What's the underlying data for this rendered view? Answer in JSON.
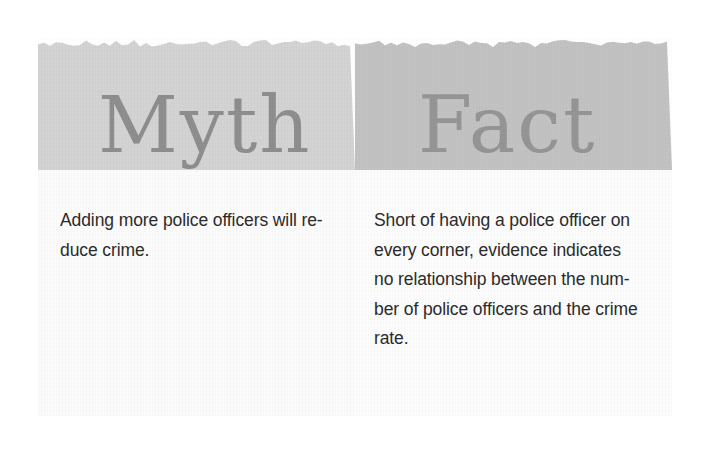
{
  "figure": {
    "type": "two-column-comparison-panel",
    "columns": [
      {
        "id": "myth",
        "heading": "Myth",
        "body": "Adding more police officers will re-\nduce crime.",
        "band_color": "#d3d3d3",
        "heading_color": "#8e8e8e",
        "body_background": "#fbfbfb"
      },
      {
        "id": "fact",
        "heading": "Fact",
        "body": "Short of having a police officer on\nevery corner, evidence indicates\nno relationship between the num-\nber of police officers and the crime\nrate.",
        "band_color": "#c2c2c2",
        "heading_color": "#959595",
        "body_background": "#fcfcfc"
      }
    ],
    "page_background": "#ffffff",
    "body_text_color": "#2b2b2b"
  }
}
